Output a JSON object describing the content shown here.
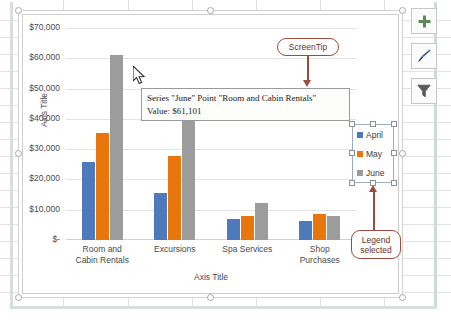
{
  "app": {
    "context": "excel-chart-selected"
  },
  "chart_buttons": [
    {
      "name": "chart-elements-button",
      "label": "+",
      "tooltip": "Chart Elements"
    },
    {
      "name": "chart-styles-button",
      "label": "brush",
      "tooltip": "Chart Styles"
    },
    {
      "name": "chart-filters-button",
      "label": "funnel",
      "tooltip": "Chart Filters"
    }
  ],
  "screentip": {
    "line1": "Series \"June\" Point \"Room and Cabin Rentals\"",
    "line2": "Value:  $61,101"
  },
  "callouts": {
    "screentip_label": "ScreenTip",
    "legend_label_line1": "Legend",
    "legend_label_line2": "selected"
  },
  "legend": {
    "entries": [
      {
        "label": "April",
        "color": "#4e79bb"
      },
      {
        "label": "May",
        "color": "#e8760d"
      },
      {
        "label": "June",
        "color": "#9c9c9c"
      }
    ]
  },
  "colors": {
    "series_april": "#4e79bb",
    "series_may": "#e8760d",
    "series_june": "#9c9c9c",
    "callout_border": "#9e4a3c",
    "gridline": "#e3e3e3"
  },
  "chart_data": {
    "type": "bar",
    "title": "",
    "xlabel": "Axis Title",
    "ylabel": "Axis Title",
    "categories": [
      "Room and Cabin Rentals",
      "Excursions",
      "Spa Services",
      "Shop Purchases"
    ],
    "category_lines": [
      [
        "Room and",
        "Cabin Rentals"
      ],
      [
        "Excursions"
      ],
      [
        "Spa Services"
      ],
      [
        "Shop",
        "Purchases"
      ]
    ],
    "series": [
      {
        "name": "April",
        "color": "#4e79bb",
        "values": [
          25800,
          15400,
          7000,
          6200
        ]
      },
      {
        "name": "May",
        "color": "#e8760d",
        "values": [
          35200,
          27600,
          8100,
          8700
        ]
      },
      {
        "name": "June",
        "color": "#9c9c9c",
        "values": [
          61101,
          47000,
          12300,
          8100
        ]
      }
    ],
    "ylim": [
      0,
      70000
    ],
    "ytick_labels": [
      "$70,000",
      "$60,000",
      "$50,000",
      "$40,000",
      "$30,000",
      "$20,000",
      "$10,000",
      "$-"
    ],
    "ytick_values": [
      70000,
      60000,
      50000,
      40000,
      30000,
      20000,
      10000,
      0
    ],
    "grid": true,
    "legend_position": "right",
    "highlighted_point": {
      "series": "June",
      "category": "Room and Cabin Rentals",
      "value": 61101
    }
  }
}
